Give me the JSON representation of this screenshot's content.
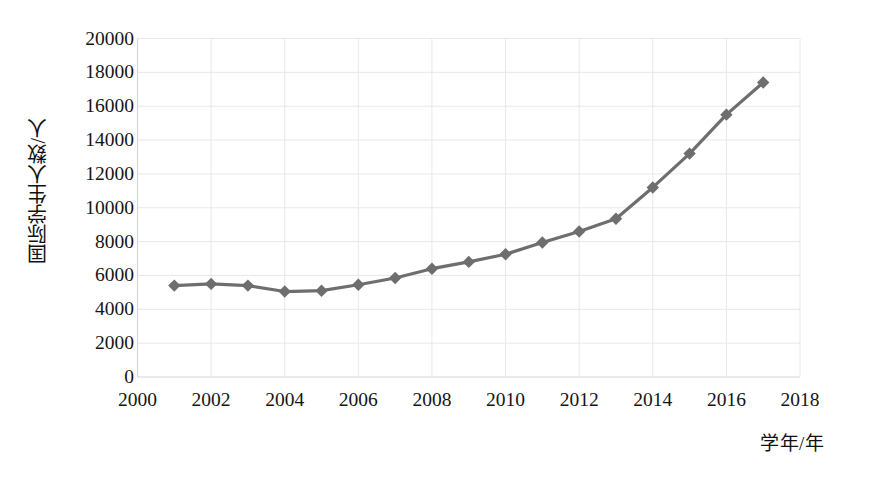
{
  "chart_data": {
    "type": "line",
    "title": "",
    "subtitle": "",
    "xlabel": "学年/年",
    "ylabel": "国际学生人数/人",
    "x": [
      2001,
      2002,
      2003,
      2004,
      2005,
      2006,
      2007,
      2008,
      2009,
      2010,
      2011,
      2012,
      2013,
      2014,
      2015,
      2016,
      2017
    ],
    "values": [
      5400,
      5500,
      5400,
      5050,
      5100,
      5450,
      5850,
      6400,
      6800,
      7250,
      7950,
      8600,
      9350,
      11200,
      13200,
      15500,
      17400
    ],
    "series": [
      {
        "name": "国际学生人数",
        "values": [
          5400,
          5500,
          5400,
          5050,
          5100,
          5450,
          5850,
          6400,
          6800,
          7250,
          7950,
          8600,
          9350,
          11200,
          13200,
          15500,
          17400
        ]
      }
    ],
    "xlim": [
      2000,
      2018
    ],
    "ylim": [
      0,
      20000
    ],
    "xticks": [
      "2000",
      "2002",
      "2004",
      "2006",
      "2008",
      "2010",
      "2012",
      "2014",
      "2016",
      "2018"
    ],
    "xtick_values": [
      2000,
      2002,
      2004,
      2006,
      2008,
      2010,
      2012,
      2014,
      2016,
      2018
    ],
    "yticks": [
      "0",
      "2000",
      "4000",
      "6000",
      "8000",
      "10000",
      "12000",
      "14000",
      "16000",
      "18000",
      "20000"
    ],
    "ytick_values": [
      0,
      2000,
      4000,
      6000,
      8000,
      10000,
      12000,
      14000,
      16000,
      18000,
      20000
    ],
    "grid": true,
    "legend": "none",
    "marker": "diamond",
    "colors": {
      "line": "#6e6e6e",
      "marker": "#6e6e6e",
      "grid": "#e8e8e8",
      "axis": "#d8d8d8",
      "text": "#141414",
      "background": "#ffffff"
    }
  }
}
